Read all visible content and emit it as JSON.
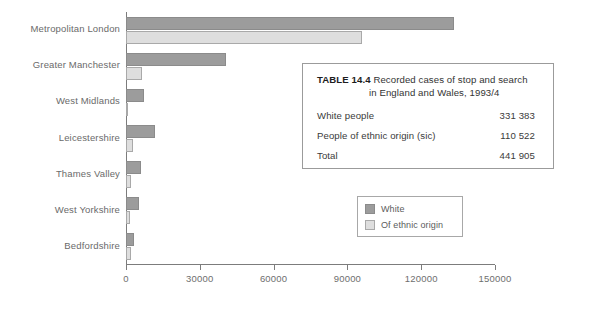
{
  "chart_data": {
    "type": "bar",
    "orientation": "horizontal",
    "title": "",
    "xlabel": "",
    "ylabel": "",
    "xlim": [
      0,
      150000
    ],
    "xticks": [
      0,
      30000,
      60000,
      90000,
      120000,
      150000
    ],
    "xtick_labels": [
      "0",
      "30000",
      "60000",
      "90000",
      "120000",
      "150000"
    ],
    "grid": false,
    "legend_position": "inside-right",
    "categories": [
      "Metropolitan London",
      "Greater Manchester",
      "West Midlands",
      "Leicestershire",
      "Thames Valley",
      "West Yorkshire",
      "Bedfordshire"
    ],
    "series": [
      {
        "name": "White",
        "color": "#9c9c9c",
        "values": [
          133500,
          40500,
          7300,
          11800,
          6200,
          5300,
          3200
        ]
      },
      {
        "name": "Of ethnic origin",
        "color": "#dedede",
        "values": [
          96000,
          6500,
          900,
          2900,
          2000,
          1600,
          2000
        ]
      }
    ]
  },
  "legend": {
    "items": [
      {
        "label": "White",
        "swatch": "white-series"
      },
      {
        "label": "Of ethnic origin",
        "swatch": "ethnic-series"
      }
    ]
  },
  "table": {
    "number_label": "TABLE 14.4",
    "title_line1": "Recorded cases of stop and search",
    "title_line2": "in England and Wales, 1993/4",
    "rows": [
      {
        "label": "White people",
        "value": "331 383"
      },
      {
        "label": "People of ethnic origin (sic)",
        "value": "110 522"
      },
      {
        "label": "Total",
        "value": "441 905"
      }
    ]
  }
}
